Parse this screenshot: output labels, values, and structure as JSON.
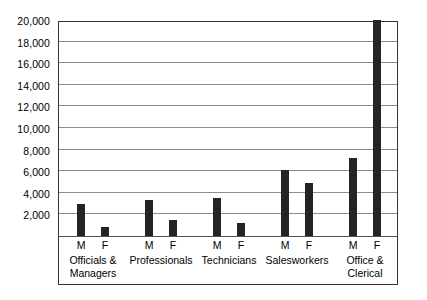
{
  "chart_data": {
    "type": "bar",
    "title": "",
    "subtitle": "",
    "xlabel": "",
    "ylabel": "",
    "ylim": [
      0,
      20000
    ],
    "ytick_step": 2000,
    "grid": true,
    "legend": false,
    "orientation": "vertical",
    "bar_color": "#242424",
    "gridline_color": "#8e8e8e",
    "axis_color": "#333333",
    "background": "#ffffff",
    "ytick_labels": [
      "2,000",
      "4,000",
      "6,000",
      "8,000",
      "10,000",
      "12,000",
      "14,000",
      "16,000",
      "18,000",
      "20,000"
    ],
    "ytick_values": [
      2000,
      4000,
      6000,
      8000,
      10000,
      12000,
      14000,
      16000,
      18000,
      20000
    ],
    "categories": [
      "Officials &\nManagers",
      "Professionals",
      "Technicians",
      "Salesworkers",
      "Office &\nClerical"
    ],
    "subgroup_labels": [
      "M",
      "F"
    ],
    "series": [
      {
        "name": "M",
        "values": [
          3000,
          3300,
          3500,
          6100,
          7200
        ]
      },
      {
        "name": "F",
        "values": [
          800,
          1500,
          1200,
          4900,
          20000
        ]
      }
    ],
    "bars": [
      {
        "category": "Officials & Managers",
        "group": "M",
        "value": 3000
      },
      {
        "category": "Officials & Managers",
        "group": "F",
        "value": 800
      },
      {
        "category": "Professionals",
        "group": "M",
        "value": 3300
      },
      {
        "category": "Professionals",
        "group": "F",
        "value": 1500
      },
      {
        "category": "Technicians",
        "group": "M",
        "value": 3500
      },
      {
        "category": "Technicians",
        "group": "F",
        "value": 1200
      },
      {
        "category": "Salesworkers",
        "group": "M",
        "value": 6100
      },
      {
        "category": "Salesworkers",
        "group": "F",
        "value": 4900
      },
      {
        "category": "Office & Clerical",
        "group": "M",
        "value": 7200
      },
      {
        "category": "Office & Clerical",
        "group": "F",
        "value": 20000
      }
    ]
  }
}
